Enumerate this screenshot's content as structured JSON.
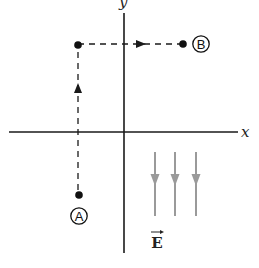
{
  "diagram": {
    "type": "physics-electric-field-path",
    "axes": {
      "x_label": "x",
      "y_label": "y",
      "origin": [
        124,
        132
      ]
    },
    "points": [
      {
        "id": "A",
        "label": "A",
        "dot": [
          79,
          195
        ],
        "label_center": [
          79,
          216
        ]
      },
      {
        "id": "corner",
        "label": "",
        "dot": [
          78,
          45
        ]
      },
      {
        "id": "B",
        "label": "B",
        "dot": [
          183,
          44
        ],
        "label_center": [
          201,
          44
        ]
      }
    ],
    "path": {
      "style": "dashed",
      "segments": [
        {
          "from": "A",
          "to": "corner",
          "direction": "up"
        },
        {
          "from": "corner",
          "to": "B",
          "direction": "right"
        }
      ]
    },
    "field": {
      "label": "E",
      "vector_symbol": "→",
      "direction": "down",
      "arrow_count": 3,
      "color": "#9a9a9a"
    },
    "colors": {
      "axis": "#1a1a1a",
      "path": "#1a1a1a",
      "field": "#9a9a9a"
    }
  }
}
